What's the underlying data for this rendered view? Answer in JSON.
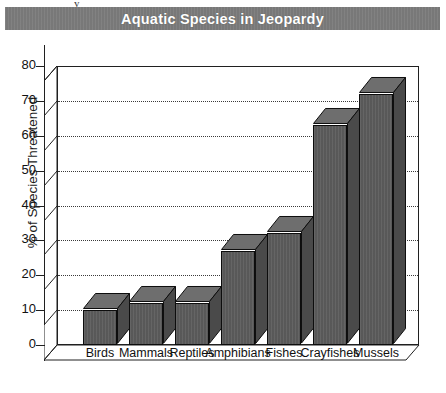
{
  "chart_data": {
    "type": "bar",
    "title": "Aquatic Species in Jeopardy",
    "xlabel": "",
    "ylabel": "% of Species Threatened",
    "categories": [
      "Birds",
      "Mammals",
      "Reptiles",
      "Amphibians",
      "Fishes",
      "Crayfishes",
      "Mussels"
    ],
    "values": [
      10,
      12,
      12,
      27,
      32,
      63,
      72
    ],
    "ylim": [
      0,
      80
    ],
    "yticks": [
      0,
      10,
      20,
      30,
      40,
      50,
      60,
      70,
      80
    ],
    "ytick_labels": [
      "0",
      "10",
      "20",
      "30",
      "40",
      "50",
      "60",
      "70",
      "80"
    ],
    "grid": true,
    "legend": false,
    "style_3d": true,
    "colors": {
      "bar_face": "#5d5d5d",
      "bar_top": "#6e6e6e",
      "bar_side": "#4a4a4a",
      "bar_outline": "#0d0d0d",
      "title_banner": "#7c7c7c",
      "title_text": "#ffffff",
      "axis": "#202020",
      "gridline": "#3a3a3a",
      "background": "#ffffff"
    }
  },
  "artifact": {
    "glyph": "y"
  }
}
